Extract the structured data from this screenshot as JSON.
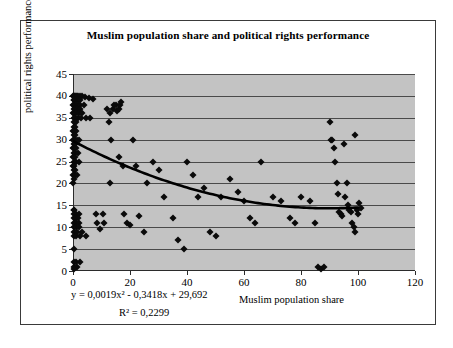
{
  "chart_data": {
    "type": "scatter",
    "title": "Muslim population share and political rights performance",
    "xlabel": "Muslim population share",
    "ylabel": "political rights performance",
    "xlim": [
      0,
      120
    ],
    "ylim": [
      0,
      45
    ],
    "xticks": [
      0,
      20,
      40,
      60,
      80,
      100,
      120
    ],
    "yticks": [
      0,
      5,
      10,
      15,
      20,
      25,
      30,
      35,
      40,
      45
    ],
    "grid": "horizontal",
    "legend": "none",
    "plot_background": "#c3c3c3",
    "marker_color": "#0a0a0a",
    "marker_shape": "diamond",
    "trendline": {
      "type": "polynomial2",
      "equation_label": "y = 0,0019x² - 0,3418x + 29,692",
      "r2_label": "R² = 0,2299",
      "a": 0.0019,
      "b": -0.3418,
      "c": 29.692,
      "r2": 0.2299,
      "x_start": 0,
      "x_end": 100,
      "color": "#000000"
    },
    "points": [
      [
        0.1,
        40
      ],
      [
        0.2,
        40
      ],
      [
        0.4,
        40
      ],
      [
        0.6,
        40
      ],
      [
        0.9,
        40
      ],
      [
        1.3,
        40
      ],
      [
        1.8,
        40
      ],
      [
        2.4,
        40
      ],
      [
        3.2,
        40
      ],
      [
        4.3,
        39.8
      ],
      [
        5.6,
        39.5
      ],
      [
        7.0,
        39.2
      ],
      [
        0.2,
        39
      ],
      [
        0.5,
        39
      ],
      [
        1.0,
        39
      ],
      [
        1.7,
        39
      ],
      [
        2.6,
        39
      ],
      [
        0.1,
        38
      ],
      [
        0.4,
        38
      ],
      [
        0.9,
        38
      ],
      [
        1.6,
        38
      ],
      [
        2.5,
        38
      ],
      [
        3.7,
        38
      ],
      [
        0.2,
        37
      ],
      [
        0.7,
        37
      ],
      [
        1.4,
        37
      ],
      [
        2.3,
        37
      ],
      [
        0.1,
        36
      ],
      [
        0.5,
        36
      ],
      [
        1.2,
        36
      ],
      [
        2.0,
        36
      ],
      [
        3.0,
        36
      ],
      [
        0.2,
        35
      ],
      [
        0.8,
        35
      ],
      [
        1.6,
        35
      ],
      [
        2.8,
        35
      ],
      [
        4.4,
        35
      ],
      [
        6.0,
        35
      ],
      [
        0.3,
        34
      ],
      [
        1.0,
        34
      ],
      [
        0.2,
        33
      ],
      [
        0.6,
        33
      ],
      [
        0.1,
        32
      ],
      [
        0.5,
        32
      ],
      [
        1.1,
        32
      ],
      [
        0.2,
        31
      ],
      [
        0.8,
        31
      ],
      [
        0.1,
        30
      ],
      [
        0.6,
        30
      ],
      [
        1.4,
        30
      ],
      [
        2.2,
        30
      ],
      [
        0.2,
        29
      ],
      [
        0.7,
        29
      ],
      [
        0.1,
        28
      ],
      [
        0.5,
        28
      ],
      [
        1.2,
        28
      ],
      [
        0.2,
        27
      ],
      [
        0.8,
        27
      ],
      [
        1.8,
        27
      ],
      [
        0.1,
        26
      ],
      [
        0.6,
        26
      ],
      [
        0.2,
        25
      ],
      [
        0.9,
        25
      ],
      [
        2.0,
        25
      ],
      [
        0.1,
        24
      ],
      [
        0.5,
        24
      ],
      [
        0.2,
        23
      ],
      [
        0.8,
        23
      ],
      [
        0.1,
        22
      ],
      [
        0.6,
        22
      ],
      [
        1.5,
        22
      ],
      [
        0.2,
        21
      ],
      [
        0.1,
        20
      ],
      [
        0.2,
        14
      ],
      [
        0.5,
        14
      ],
      [
        0.3,
        13
      ],
      [
        1.1,
        13
      ],
      [
        2.0,
        13
      ],
      [
        0.2,
        12
      ],
      [
        0.9,
        12
      ],
      [
        1.8,
        12
      ],
      [
        0.4,
        11
      ],
      [
        1.2,
        11
      ],
      [
        2.2,
        11
      ],
      [
        0.2,
        10
      ],
      [
        1.0,
        10
      ],
      [
        2.0,
        10
      ],
      [
        0.3,
        9
      ],
      [
        1.4,
        9
      ],
      [
        3.2,
        9
      ],
      [
        0.2,
        8
      ],
      [
        1.1,
        8
      ],
      [
        2.6,
        8
      ],
      [
        4.4,
        8
      ],
      [
        0.2,
        5
      ],
      [
        0.3,
        2
      ],
      [
        1.2,
        2
      ],
      [
        2.4,
        2
      ],
      [
        0.4,
        1
      ],
      [
        1.5,
        1
      ],
      [
        0.3,
        0.5
      ],
      [
        8.0,
        13
      ],
      [
        8.5,
        11
      ],
      [
        9.5,
        9.5
      ],
      [
        10.5,
        13
      ],
      [
        11.0,
        11
      ],
      [
        12.0,
        37
      ],
      [
        13.0,
        36
      ],
      [
        14.0,
        37
      ],
      [
        14.5,
        38
      ],
      [
        15.0,
        38
      ],
      [
        15.5,
        36.5
      ],
      [
        16.0,
        37
      ],
      [
        16.5,
        38
      ],
      [
        17.0,
        38.5
      ],
      [
        12.5,
        34
      ],
      [
        13.5,
        30
      ],
      [
        13.0,
        20
      ],
      [
        16.0,
        26
      ],
      [
        17.5,
        24
      ],
      [
        18.0,
        13
      ],
      [
        19.0,
        11
      ],
      [
        20.0,
        10.5
      ],
      [
        21.0,
        30
      ],
      [
        22.0,
        24
      ],
      [
        23.0,
        12.5
      ],
      [
        25.0,
        9
      ],
      [
        26.0,
        20
      ],
      [
        28.0,
        25
      ],
      [
        30.0,
        23
      ],
      [
        32.0,
        17
      ],
      [
        35.0,
        12
      ],
      [
        37.0,
        7
      ],
      [
        39.0,
        5
      ],
      [
        40.0,
        25
      ],
      [
        42.0,
        22
      ],
      [
        44.0,
        17
      ],
      [
        46.0,
        19
      ],
      [
        48.0,
        9
      ],
      [
        50.0,
        8
      ],
      [
        52.0,
        17
      ],
      [
        55.0,
        21
      ],
      [
        58.0,
        18
      ],
      [
        60.0,
        16
      ],
      [
        62.0,
        12
      ],
      [
        64.0,
        11
      ],
      [
        66.0,
        25
      ],
      [
        70.0,
        17
      ],
      [
        73.0,
        16
      ],
      [
        76.0,
        12
      ],
      [
        78.0,
        11
      ],
      [
        80.0,
        17
      ],
      [
        83.0,
        16
      ],
      [
        85.0,
        11
      ],
      [
        86.0,
        1
      ],
      [
        87.0,
        0.5
      ],
      [
        88.0,
        0.8
      ],
      [
        90.0,
        34
      ],
      [
        90.5,
        30
      ],
      [
        91.0,
        30
      ],
      [
        91.5,
        28
      ],
      [
        92.0,
        25
      ],
      [
        92.5,
        20
      ],
      [
        93.0,
        17.5
      ],
      [
        93.5,
        13.5
      ],
      [
        94.0,
        13
      ],
      [
        94.5,
        12.5
      ],
      [
        95.0,
        29
      ],
      [
        95.5,
        17
      ],
      [
        96.0,
        20
      ],
      [
        96.5,
        15
      ],
      [
        97.0,
        14
      ],
      [
        97.5,
        13.5
      ],
      [
        98.0,
        11
      ],
      [
        98.5,
        10
      ],
      [
        99.0,
        31
      ],
      [
        99.5,
        14
      ],
      [
        100.0,
        13
      ],
      [
        100.5,
        15.5
      ],
      [
        101.0,
        14.5
      ],
      [
        99.0,
        9
      ]
    ]
  }
}
